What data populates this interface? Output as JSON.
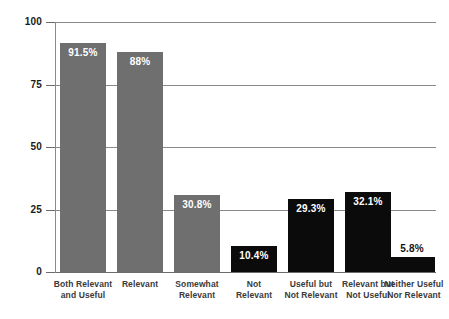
{
  "chart_data": {
    "type": "bar",
    "title": "",
    "subtitle": "",
    "xlabel": "",
    "ylabel": "",
    "ylim": [
      0,
      100
    ],
    "yticks": [
      "0",
      "25",
      "50",
      "75",
      "100"
    ],
    "grid": true,
    "legend": false,
    "categories": [
      "Both Relevant and Useful",
      "Relevant",
      "Somewhat Relevant",
      "Not Relevant",
      "Useful but Not Relevant",
      "Relevant but Not Useful",
      "Neither Useful Nor Relevant"
    ],
    "category_lines": [
      [
        "Both Relevant",
        "and Useful"
      ],
      [
        "Relevant"
      ],
      [
        "Somewhat",
        "Relevant"
      ],
      [
        "Not",
        "Relevant"
      ],
      [
        "Useful but",
        "Not Relevant"
      ],
      [
        "Relevant but",
        "Not Useful"
      ],
      [
        "Neither Useful",
        "Nor Relevant"
      ]
    ],
    "values": [
      91.5,
      88,
      30.8,
      10.4,
      29.3,
      32.1,
      5.8
    ],
    "value_labels": [
      "91.5%",
      "88%",
      "30.8%",
      "10.4%",
      "29.3%",
      "32.1%",
      "5.8%"
    ],
    "label_placement": [
      "inside",
      "inside",
      "inside",
      "inside",
      "inside",
      "inside",
      "above"
    ],
    "bar_colors": [
      "#6f6f6f",
      "#6f6f6f",
      "#6f6f6f",
      "#0b0b0b",
      "#0b0b0b",
      "#0b0b0b",
      "#0b0b0b"
    ],
    "colors": {
      "gray_series": "#6f6f6f",
      "black_series": "#0b0b0b",
      "gridline": "#8a8a8a",
      "axis": "#6b6b6b",
      "tick_label": "#1b1b1b",
      "category_label": "#3a3a3a",
      "value_label_inside": "#ffffff",
      "value_label_above": "#141414",
      "background": "#ffffff"
    }
  }
}
